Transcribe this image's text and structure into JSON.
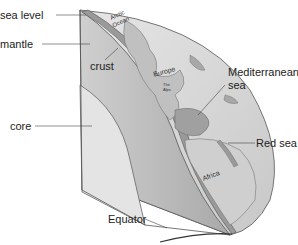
{
  "diagram": {
    "type": "earth-cross-section",
    "labels": {
      "sea_level": "sea level",
      "mantle": "mantle",
      "crust": "crust",
      "core": "core",
      "mediterranean_line1": "Mediterranean",
      "mediterranean_line2": "sea",
      "red_sea": "Red sea",
      "equator": "Equator"
    },
    "map_labels": {
      "arctic_line1": "Arctic",
      "arctic_line2": "Ocean",
      "europe": "Europe",
      "alps_line1": "The",
      "alps_line2": "Alps",
      "africa": "Africa"
    },
    "colors": {
      "core": "#e4e4e4",
      "mantle": "#c4c4c4",
      "crust": "#9a9a9a",
      "surface": "#d8d8d8",
      "land": "#a8a8a8",
      "outline": "#555555"
    }
  }
}
